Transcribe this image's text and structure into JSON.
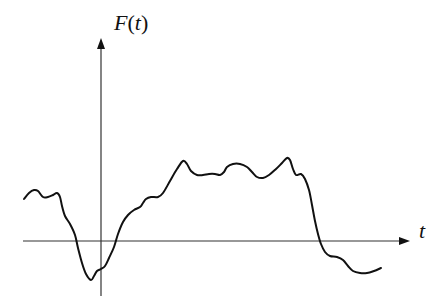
{
  "chart_data": {
    "type": "line",
    "title": "",
    "xlabel": "t",
    "ylabel": "F(t)",
    "ylabel_parts": {
      "func": "F",
      "open": "(",
      "var": "t",
      "close": ")"
    },
    "grid": false,
    "legend": null,
    "ticks": [],
    "series": [
      {
        "name": "F(t)",
        "color": "#111111",
        "points_px": [
          [
            24,
            199
          ],
          [
            29,
            193
          ],
          [
            34,
            190
          ],
          [
            38,
            191
          ],
          [
            43,
            197
          ],
          [
            48,
            197
          ],
          [
            53,
            195
          ],
          [
            57,
            193
          ],
          [
            60,
            197
          ],
          [
            62,
            206
          ],
          [
            65,
            216
          ],
          [
            70,
            224
          ],
          [
            75,
            235
          ],
          [
            78,
            248
          ],
          [
            82,
            263
          ],
          [
            86,
            274
          ],
          [
            91,
            280
          ],
          [
            94,
            276
          ],
          [
            97,
            271
          ],
          [
            101,
            269
          ],
          [
            105,
            266
          ],
          [
            109,
            258
          ],
          [
            114,
            247
          ],
          [
            118,
            234
          ],
          [
            123,
            222
          ],
          [
            128,
            215
          ],
          [
            134,
            210
          ],
          [
            140,
            207
          ],
          [
            143,
            203
          ],
          [
            146,
            199
          ],
          [
            151,
            197
          ],
          [
            158,
            197
          ],
          [
            163,
            193
          ],
          [
            170,
            181
          ],
          [
            177,
            169
          ],
          [
            183,
            161
          ],
          [
            187,
            164
          ],
          [
            191,
            171
          ],
          [
            197,
            175
          ],
          [
            203,
            175
          ],
          [
            209,
            174
          ],
          [
            215,
            174
          ],
          [
            220,
            175
          ],
          [
            224,
            172
          ],
          [
            227,
            167
          ],
          [
            233,
            164
          ],
          [
            240,
            164
          ],
          [
            247,
            167
          ],
          [
            252,
            172
          ],
          [
            257,
            177
          ],
          [
            263,
            178
          ],
          [
            269,
            175
          ],
          [
            276,
            169
          ],
          [
            282,
            163
          ],
          [
            287,
            158
          ],
          [
            290,
            160
          ],
          [
            293,
            169
          ],
          [
            296,
            175
          ],
          [
            301,
            174
          ],
          [
            305,
            179
          ],
          [
            309,
            190
          ],
          [
            312,
            205
          ],
          [
            315,
            221
          ],
          [
            318,
            234
          ],
          [
            321,
            244
          ],
          [
            325,
            252
          ],
          [
            330,
            256
          ],
          [
            337,
            257
          ],
          [
            343,
            260
          ],
          [
            348,
            266
          ],
          [
            353,
            271
          ],
          [
            360,
            273
          ],
          [
            367,
            273
          ],
          [
            374,
            271
          ],
          [
            381,
            268
          ]
        ]
      }
    ],
    "axes": {
      "x_axis": {
        "y_px": 241,
        "from_x_px": 23,
        "to_x_px": 410,
        "arrow": true
      },
      "y_axis": {
        "x_px": 101,
        "from_y_px": 296,
        "to_y_px": 38,
        "arrow": true
      }
    }
  }
}
